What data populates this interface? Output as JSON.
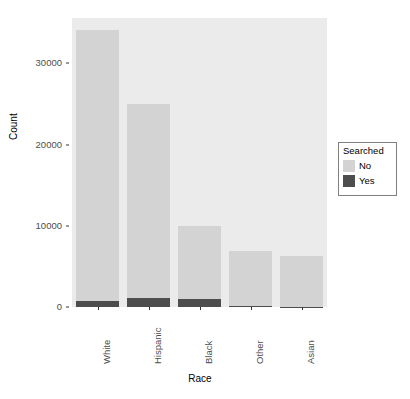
{
  "chart_data": {
    "type": "bar",
    "subtype": "stacked-bar",
    "title": "",
    "subtitle": "",
    "xlabel": "Race",
    "ylabel": "Count",
    "categories": [
      "White",
      "Hispanic",
      "Black",
      "Other",
      "Asian"
    ],
    "series": [
      {
        "name": "No",
        "values": [
          33350,
          23900,
          9000,
          6850,
          6280
        ],
        "color": "#d3d3d3"
      },
      {
        "name": "Yes",
        "values": [
          750,
          1100,
          1000,
          90,
          60
        ],
        "color": "#4d4d4d"
      }
    ],
    "totals": [
      34100,
      25000,
      10000,
      6940,
      6340
    ],
    "ylim": [
      0,
      35600
    ],
    "yticks": [
      0,
      10000,
      20000,
      30000
    ],
    "ytick_labels": [
      "0",
      "10000",
      "20000",
      "30000"
    ],
    "xtick_labels": [
      "White",
      "Hispanic",
      "Black",
      "Other",
      "Asian"
    ],
    "grid": false,
    "panel_background": "#ebebeb",
    "legend": {
      "title": "Searched",
      "position": "right",
      "entries": [
        {
          "label": "No",
          "color": "#d3d3d3"
        },
        {
          "label": "Yes",
          "color": "#4d4d4d"
        }
      ]
    }
  },
  "axes": {
    "y": {
      "title": "Count",
      "ticks": [
        {
          "value": 0,
          "label": "0"
        },
        {
          "value": 10000,
          "label": "10000"
        },
        {
          "value": 20000,
          "label": "20000"
        },
        {
          "value": 30000,
          "label": "30000"
        }
      ]
    },
    "x": {
      "title": "Race",
      "ticks": [
        {
          "label": "White"
        },
        {
          "label": "Hispanic"
        },
        {
          "label": "Black"
        },
        {
          "label": "Other"
        },
        {
          "label": "Asian"
        }
      ]
    }
  },
  "legend": {
    "title": "Searched",
    "items": [
      {
        "label": "No",
        "color": "#d3d3d3"
      },
      {
        "label": "Yes",
        "color": "#4d4d4d"
      }
    ]
  }
}
